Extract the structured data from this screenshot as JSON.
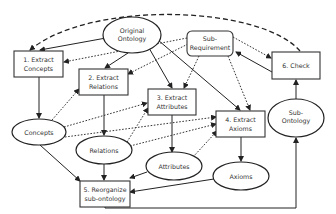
{
  "diagram": {
    "type": "flowchart",
    "nodes": {
      "original_ontology": {
        "lines": [
          "Original",
          "Ontology"
        ],
        "shape": "ellipse"
      },
      "sub_requirement": {
        "lines": [
          "Sub-",
          "Requirement"
        ],
        "shape": "rounded-rect"
      },
      "extract_concepts": {
        "lines": [
          "1. Extract",
          "Concepts"
        ],
        "shape": "rect"
      },
      "extract_relations": {
        "lines": [
          "2. Extract",
          "Relations"
        ],
        "shape": "rect"
      },
      "extract_attributes": {
        "lines": [
          "3. Extract",
          "Attributes"
        ],
        "shape": "rect"
      },
      "extract_axioms": {
        "lines": [
          "4. Extract",
          "Axioms"
        ],
        "shape": "rect"
      },
      "reorganize": {
        "lines": [
          "5. Reorganize",
          "sub-ontology"
        ],
        "shape": "rect"
      },
      "check": {
        "lines": [
          "6. Check"
        ],
        "shape": "rect"
      },
      "concepts": {
        "lines": [
          "Concepts"
        ],
        "shape": "ellipse"
      },
      "relations": {
        "lines": [
          "Relations"
        ],
        "shape": "ellipse"
      },
      "attributes": {
        "lines": [
          "Attributes"
        ],
        "shape": "ellipse"
      },
      "axioms": {
        "lines": [
          "Axioms"
        ],
        "shape": "ellipse"
      },
      "sub_ontology": {
        "lines": [
          "Sub-",
          "Ontology"
        ],
        "shape": "ellipse"
      }
    },
    "edges": [
      {
        "from": "Original Ontology",
        "to": "1. Extract Concepts",
        "style": "solid"
      },
      {
        "from": "Original Ontology",
        "to": "2. Extract Relations",
        "style": "solid"
      },
      {
        "from": "Original Ontology",
        "to": "3. Extract Attributes",
        "style": "solid"
      },
      {
        "from": "Original Ontology",
        "to": "4. Extract Axioms",
        "style": "solid"
      },
      {
        "from": "Sub-Requirement",
        "to": "1. Extract Concepts",
        "style": "dotted"
      },
      {
        "from": "Sub-Requirement",
        "to": "2. Extract Relations",
        "style": "dotted"
      },
      {
        "from": "Sub-Requirement",
        "to": "3. Extract Attributes",
        "style": "dotted"
      },
      {
        "from": "Sub-Requirement",
        "to": "4. Extract Axioms",
        "style": "dotted"
      },
      {
        "from": "Sub-Requirement",
        "to": "6. Check",
        "style": "dotted"
      },
      {
        "from": "6. Check",
        "to": "Sub-Requirement",
        "style": "solid"
      },
      {
        "from": "6. Check",
        "to": "1. Extract Concepts",
        "style": "dashed"
      },
      {
        "from": "1. Extract Concepts",
        "to": "Concepts",
        "style": "solid"
      },
      {
        "from": "2. Extract Relations",
        "to": "Relations",
        "style": "solid"
      },
      {
        "from": "3. Extract Attributes",
        "to": "Attributes",
        "style": "solid"
      },
      {
        "from": "4. Extract Axioms",
        "to": "Axioms",
        "style": "solid"
      },
      {
        "from": "Concepts",
        "to": "2. Extract Relations",
        "style": "dotted"
      },
      {
        "from": "Concepts",
        "to": "3. Extract Attributes",
        "style": "dotted"
      },
      {
        "from": "Concepts",
        "to": "4. Extract Axioms",
        "style": "dotted"
      },
      {
        "from": "Relations",
        "to": "3. Extract Attributes",
        "style": "dotted"
      },
      {
        "from": "Relations",
        "to": "4. Extract Axioms",
        "style": "dotted"
      },
      {
        "from": "Attributes",
        "to": "4. Extract Axioms",
        "style": "dotted"
      },
      {
        "from": "Concepts",
        "to": "5. Reorganize sub-ontology",
        "style": "solid"
      },
      {
        "from": "Relations",
        "to": "5. Reorganize sub-ontology",
        "style": "solid"
      },
      {
        "from": "Attributes",
        "to": "5. Reorganize sub-ontology",
        "style": "solid"
      },
      {
        "from": "Axioms",
        "to": "5. Reorganize sub-ontology",
        "style": "solid"
      },
      {
        "from": "5. Reorganize sub-ontology",
        "to": "Sub-Ontology",
        "style": "solid"
      },
      {
        "from": "Sub-Ontology",
        "to": "6. Check",
        "style": "solid"
      }
    ]
  }
}
